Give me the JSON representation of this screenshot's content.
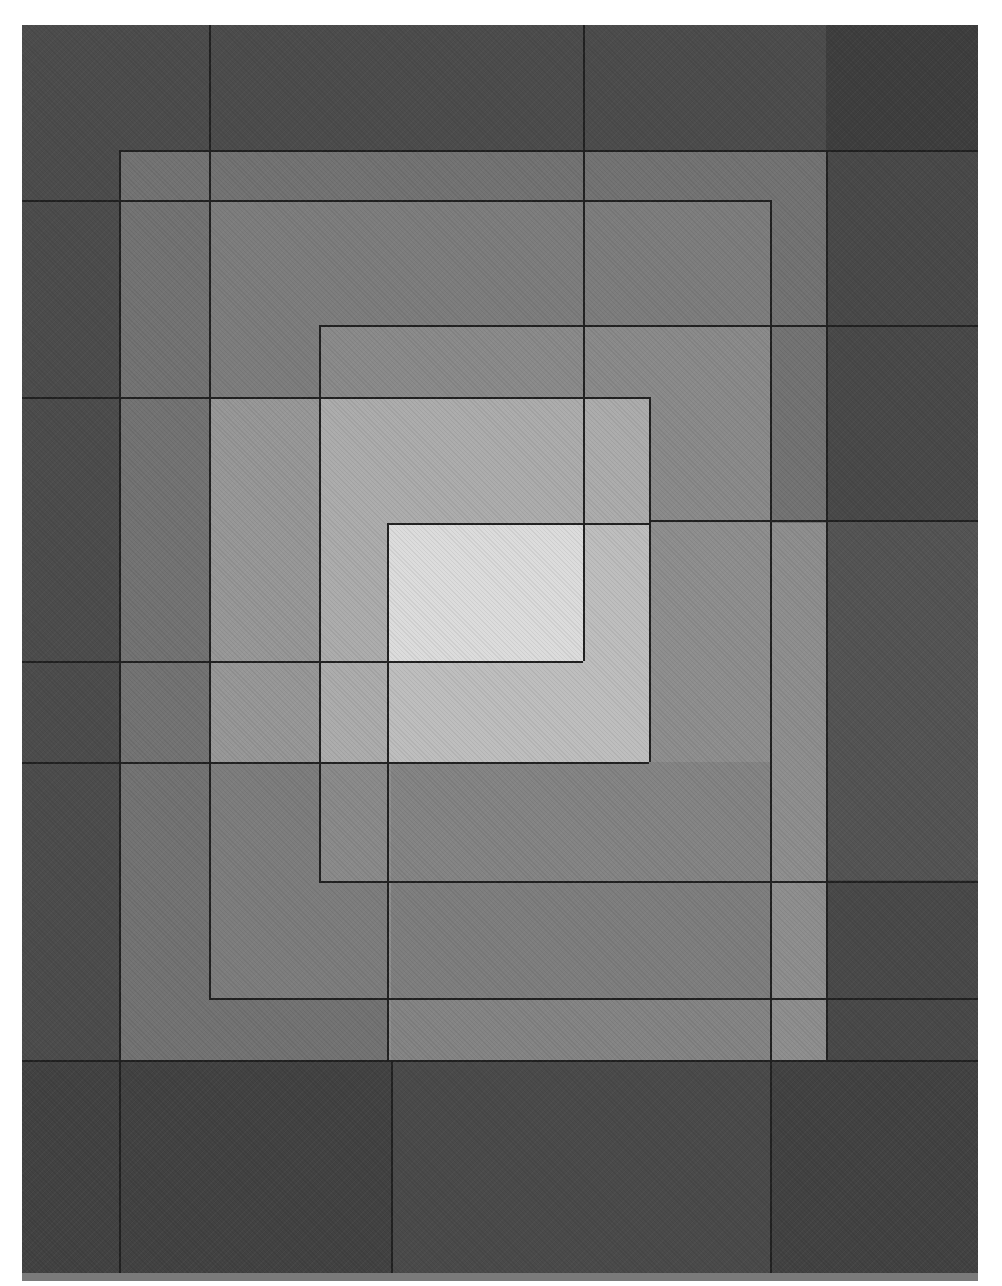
{
  "artwork": {
    "description": "Abstract grayscale painting of overlapping nested rectangles with a light center",
    "palette": {
      "paper": "#ffffff",
      "darkest": "#3f3f3f",
      "dark": "#4d4d4d",
      "dark_mid": "#5c5c5c",
      "frame": "#717171",
      "mid": "#858585",
      "mid_light": "#9c9c9c",
      "light": "#b2b2b2",
      "lighter": "#c2c2c2",
      "center": "#d9d9d9",
      "line": "#232323"
    },
    "regions": [
      {
        "name": "outer-background",
        "x": 22,
        "y": 25,
        "w": 956,
        "h": 1252,
        "color": "#4d4d4d"
      },
      {
        "name": "top-right-dark",
        "x": 826,
        "y": 25,
        "w": 152,
        "h": 125,
        "color": "#3f3f3f"
      },
      {
        "name": "right-dark-band",
        "x": 826,
        "y": 150,
        "w": 152,
        "h": 1127,
        "color": "#4a4a4a"
      },
      {
        "name": "right-mid-band",
        "x": 826,
        "y": 520,
        "w": 152,
        "h": 360,
        "color": "#555555"
      },
      {
        "name": "bottom-dark",
        "x": 22,
        "y": 1060,
        "w": 956,
        "h": 217,
        "color": "#434343"
      },
      {
        "name": "bottom-mid-panel",
        "x": 391,
        "y": 1060,
        "w": 379,
        "h": 217,
        "color": "#4b4b4b"
      },
      {
        "name": "frame-rect",
        "x": 119,
        "y": 150,
        "w": 707,
        "h": 910,
        "color": "#737373"
      },
      {
        "name": "second-rect",
        "x": 209,
        "y": 200,
        "w": 561,
        "h": 798,
        "color": "#7d7d7d"
      },
      {
        "name": "upper-inner-rect",
        "x": 319,
        "y": 325,
        "w": 451,
        "h": 556,
        "color": "#8a8a8a"
      },
      {
        "name": "left-mid-rect",
        "x": 209,
        "y": 397,
        "w": 440,
        "h": 365,
        "color": "#979797"
      },
      {
        "name": "light-upper-rect",
        "x": 319,
        "y": 397,
        "w": 330,
        "h": 365,
        "color": "#ababab"
      },
      {
        "name": "lower-right-rect",
        "x": 387,
        "y": 523,
        "w": 439,
        "h": 537,
        "color": "#8e8e8e"
      },
      {
        "name": "lower-light-rect",
        "x": 387,
        "y": 523,
        "w": 262,
        "h": 239,
        "color": "#bdbdbd"
      },
      {
        "name": "center-light",
        "x": 387,
        "y": 523,
        "w": 196,
        "h": 138,
        "color": "#dadada"
      },
      {
        "name": "lower-band",
        "x": 391,
        "y": 762,
        "w": 379,
        "h": 298,
        "color": "#848484"
      },
      {
        "name": "lower-band-inner",
        "x": 391,
        "y": 881,
        "w": 379,
        "h": 117,
        "color": "#7e7e7e"
      }
    ],
    "lines": {
      "vertical": [
        {
          "x": 119,
          "y1": 150,
          "y2": 1277
        },
        {
          "x": 209,
          "y1": 25,
          "y2": 998
        },
        {
          "x": 319,
          "y1": 325,
          "y2": 881
        },
        {
          "x": 387,
          "y1": 523,
          "y2": 1060
        },
        {
          "x": 391,
          "y1": 1060,
          "y2": 1277
        },
        {
          "x": 583,
          "y1": 25,
          "y2": 661
        },
        {
          "x": 649,
          "y1": 397,
          "y2": 762
        },
        {
          "x": 770,
          "y1": 200,
          "y2": 1277
        },
        {
          "x": 826,
          "y1": 150,
          "y2": 1060
        }
      ],
      "horizontal": [
        {
          "y": 150,
          "x1": 119,
          "x2": 978
        },
        {
          "y": 200,
          "x1": 22,
          "x2": 770
        },
        {
          "y": 325,
          "x1": 319,
          "x2": 978
        },
        {
          "y": 397,
          "x1": 22,
          "x2": 649
        },
        {
          "y": 520,
          "x1": 649,
          "x2": 978
        },
        {
          "y": 523,
          "x1": 387,
          "x2": 649
        },
        {
          "y": 661,
          "x1": 22,
          "x2": 583
        },
        {
          "y": 762,
          "x1": 22,
          "x2": 649
        },
        {
          "y": 881,
          "x1": 319,
          "x2": 978
        },
        {
          "y": 998,
          "x1": 209,
          "x2": 978
        },
        {
          "y": 1060,
          "x1": 22,
          "x2": 978
        }
      ]
    }
  }
}
